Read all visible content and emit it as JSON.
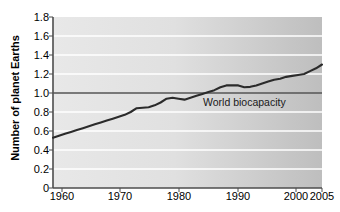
{
  "chart_data": {
    "type": "line",
    "title": "",
    "xlabel": "",
    "ylabel": "Number of planet Earths",
    "xlim": [
      1960,
      2005
    ],
    "ylim": [
      0,
      1.8
    ],
    "grid": true,
    "legend": "none",
    "x_ticks": [
      1960,
      1970,
      1980,
      1990,
      2000,
      2005
    ],
    "x_tick_labels": [
      "1960",
      "1970",
      "1980",
      "1990",
      "2000",
      "2005"
    ],
    "y_ticks": [
      0,
      0.2,
      0.4,
      0.6,
      0.8,
      1.0,
      1.2,
      1.4,
      1.6,
      1.8
    ],
    "y_tick_labels": [
      "0",
      "0.2",
      "0.4",
      "0.6",
      "0.8",
      "1.0",
      "1.2",
      "1.4",
      "1.6",
      "1.8"
    ],
    "series": [
      {
        "name": "Ecological footprint",
        "color": "#2b2b2b",
        "x": [
          1960,
          1961,
          1962,
          1963,
          1964,
          1965,
          1966,
          1967,
          1968,
          1969,
          1970,
          1971,
          1972,
          1973,
          1974,
          1975,
          1976,
          1977,
          1978,
          1979,
          1980,
          1981,
          1982,
          1983,
          1984,
          1985,
          1986,
          1987,
          1988,
          1989,
          1990,
          1991,
          1992,
          1993,
          1994,
          1995,
          1996,
          1997,
          1998,
          1999,
          2000,
          2001,
          2002,
          2003,
          2004,
          2005
        ],
        "values": [
          0.53,
          0.55,
          0.57,
          0.59,
          0.61,
          0.63,
          0.65,
          0.67,
          0.69,
          0.71,
          0.73,
          0.75,
          0.77,
          0.8,
          0.84,
          0.845,
          0.85,
          0.87,
          0.9,
          0.94,
          0.95,
          0.94,
          0.93,
          0.95,
          0.97,
          0.99,
          1.01,
          1.03,
          1.06,
          1.08,
          1.08,
          1.08,
          1.06,
          1.065,
          1.08,
          1.1,
          1.12,
          1.14,
          1.15,
          1.17,
          1.18,
          1.19,
          1.2,
          1.23,
          1.26,
          1.3
        ]
      }
    ],
    "reference_line": {
      "name": "World biocapacity",
      "label": "World biocapacity",
      "value": 1.0,
      "color": "#555555"
    },
    "style": {
      "plot_background_left": "#e6e6e6",
      "plot_background_right": "#bfbfbf",
      "gridline_color": "#ffffff",
      "axis_color": "#4d4d4d",
      "text_color": "#000000"
    }
  }
}
